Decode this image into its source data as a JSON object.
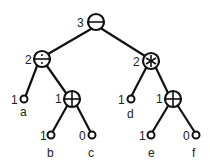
{
  "diagram": {
    "type": "expression-tree",
    "nodes": [
      {
        "id": "root",
        "kind": "operator",
        "symbol": "minus",
        "glyph": "−",
        "label": "3"
      },
      {
        "id": "div",
        "kind": "operator",
        "symbol": "divide",
        "glyph": "÷",
        "label": "2"
      },
      {
        "id": "mul",
        "kind": "operator",
        "symbol": "multiply",
        "glyph": "∗",
        "label": "2"
      },
      {
        "id": "a",
        "kind": "leaf",
        "name": "a",
        "label": "1"
      },
      {
        "id": "plus1",
        "kind": "operator",
        "symbol": "plus",
        "glyph": "⊕",
        "label": "1"
      },
      {
        "id": "b",
        "kind": "leaf",
        "name": "b",
        "label": "1"
      },
      {
        "id": "c",
        "kind": "leaf",
        "name": "c",
        "label": "0"
      },
      {
        "id": "d",
        "kind": "leaf",
        "name": "d",
        "label": "1"
      },
      {
        "id": "plus2",
        "kind": "operator",
        "symbol": "plus",
        "glyph": "⊕",
        "label": "1"
      },
      {
        "id": "e",
        "kind": "leaf",
        "name": "e",
        "label": "1"
      },
      {
        "id": "f",
        "kind": "leaf",
        "name": "f",
        "label": "0"
      }
    ],
    "edges": [
      [
        "root",
        "div"
      ],
      [
        "root",
        "mul"
      ],
      [
        "div",
        "a"
      ],
      [
        "div",
        "plus1"
      ],
      [
        "plus1",
        "b"
      ],
      [
        "plus1",
        "c"
      ],
      [
        "mul",
        "d"
      ],
      [
        "mul",
        "plus2"
      ],
      [
        "plus2",
        "e"
      ],
      [
        "plus2",
        "f"
      ]
    ]
  },
  "labels": {
    "root": "3",
    "div": "2",
    "mul": "2",
    "a_num": "1",
    "a_name": "a",
    "plus1": "1",
    "b_num": "1",
    "b_name": "b",
    "c_num": "0",
    "c_name": "c",
    "d_num": "1",
    "d_name": "d",
    "plus2": "1",
    "e_num": "1",
    "e_name": "e",
    "f_num": "0",
    "f_name": "f"
  }
}
